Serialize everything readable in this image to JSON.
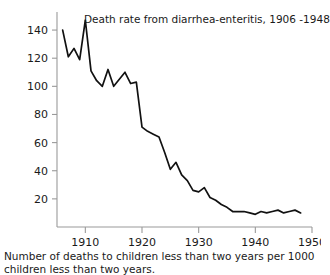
{
  "chart_data": {
    "type": "line",
    "title": "Death rate from diarrhea-enteritis, 1906 -1948",
    "caption": "Number of deaths to children less than two years per 1000 children less than two years.",
    "xlabel": "",
    "ylabel": "",
    "xlim": [
      1905,
      1950
    ],
    "ylim": [
      0,
      150
    ],
    "grid": false,
    "legend": null,
    "line_color": "#111111",
    "axis_color": "#9a9a9a",
    "background_color": "#ffffff",
    "xticks": [
      1910,
      1920,
      1930,
      1940,
      1950
    ],
    "xtick_labels": [
      "1910",
      "1920",
      "1930",
      "1940",
      "1950"
    ],
    "yticks": [
      20,
      40,
      60,
      80,
      100,
      120,
      140
    ],
    "ytick_labels": [
      "20",
      "40",
      "60",
      "80",
      "100",
      "120",
      "140"
    ],
    "x": [
      1906,
      1907,
      1908,
      1909,
      1910,
      1911,
      1912,
      1913,
      1914,
      1915,
      1916,
      1917,
      1918,
      1919,
      1920,
      1921,
      1922,
      1923,
      1924,
      1925,
      1926,
      1927,
      1928,
      1929,
      1930,
      1931,
      1932,
      1933,
      1934,
      1935,
      1936,
      1937,
      1938,
      1939,
      1940,
      1941,
      1942,
      1943,
      1944,
      1945,
      1946,
      1947,
      1948
    ],
    "values": [
      140,
      121,
      127,
      119,
      147,
      111,
      104,
      100,
      112,
      100,
      105,
      110,
      102,
      103,
      71,
      68,
      66,
      64,
      53,
      41,
      46,
      37,
      33,
      26,
      25,
      28,
      21,
      19,
      16,
      14,
      11,
      11,
      11,
      10,
      9,
      11,
      10,
      11,
      12,
      10,
      11,
      12,
      10
    ],
    "series_name": "Death rate per 1000 children under two years"
  },
  "figure": {
    "title_text": "Death rate from diarrhea-enteritis, 1906 -1948",
    "caption_text": "Number of deaths to children less than two years per 1000 children less than two years."
  }
}
